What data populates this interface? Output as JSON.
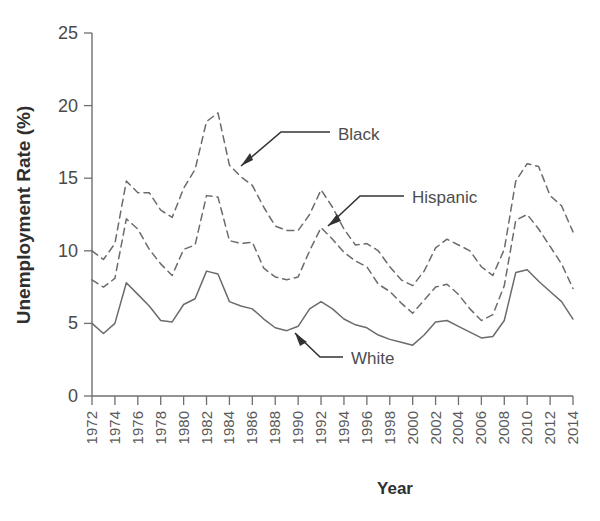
{
  "figure": {
    "background": "#ffffff",
    "line_color": "#6b6b6b",
    "text_color": "#4a4a4a"
  },
  "axes": {
    "ylabel": "Unemployment Rate (%)",
    "xlabel": "Year",
    "yticks": [
      "25",
      "20",
      "15",
      "10",
      "5",
      "0"
    ],
    "xticks": [
      "1972",
      "1974",
      "1976",
      "1978",
      "1980",
      "1982",
      "1984",
      "1986",
      "1988",
      "1990",
      "1992",
      "1994",
      "1996",
      "1998",
      "2000",
      "2002",
      "2004",
      "2006",
      "2008",
      "2010",
      "2012",
      "2014"
    ]
  },
  "annotations": [
    {
      "label": "Black",
      "name": "annotation-black"
    },
    {
      "label": "Hispanic",
      "name": "annotation-hispanic"
    },
    {
      "label": "White",
      "name": "annotation-white"
    }
  ],
  "caption": " ",
  "chart_data": {
    "type": "line",
    "title": "",
    "xlabel": "Year",
    "ylabel": "Unemployment Rate (%)",
    "xlim": [
      1972,
      2014
    ],
    "ylim": [
      0,
      25
    ],
    "grid": false,
    "legend": "annotated-inline",
    "x": [
      1972,
      1973,
      1974,
      1975,
      1976,
      1977,
      1978,
      1979,
      1980,
      1981,
      1982,
      1983,
      1984,
      1985,
      1986,
      1987,
      1988,
      1989,
      1990,
      1991,
      1992,
      1993,
      1994,
      1995,
      1996,
      1997,
      1998,
      1999,
      2000,
      2001,
      2002,
      2003,
      2004,
      2005,
      2006,
      2007,
      2008,
      2009,
      2010,
      2011,
      2012,
      2013,
      2014
    ],
    "series": [
      {
        "name": "Black",
        "style": "dashed",
        "values": [
          10.0,
          9.4,
          10.5,
          14.8,
          14.0,
          14.0,
          12.8,
          12.3,
          14.3,
          15.6,
          18.9,
          19.5,
          15.9,
          15.1,
          14.5,
          13.0,
          11.7,
          11.4,
          11.4,
          12.5,
          14.2,
          13.0,
          11.5,
          10.4,
          10.5,
          10.0,
          8.9,
          8.0,
          7.6,
          8.6,
          10.2,
          10.8,
          10.4,
          10.0,
          8.9,
          8.3,
          10.1,
          14.8,
          16.0,
          15.8,
          13.8,
          13.1,
          11.3
        ]
      },
      {
        "name": "Hispanic",
        "style": "dashed",
        "values": [
          8.0,
          7.5,
          8.1,
          12.2,
          11.5,
          10.1,
          9.1,
          8.3,
          10.1,
          10.4,
          13.8,
          13.7,
          10.7,
          10.5,
          10.6,
          8.8,
          8.2,
          8.0,
          8.2,
          10.0,
          11.6,
          10.8,
          9.9,
          9.3,
          8.9,
          7.7,
          7.2,
          6.4,
          5.7,
          6.6,
          7.5,
          7.7,
          7.0,
          6.0,
          5.2,
          5.6,
          7.6,
          12.1,
          12.5,
          11.5,
          10.3,
          9.1,
          7.4
        ]
      },
      {
        "name": "White",
        "style": "solid",
        "values": [
          5.0,
          4.3,
          5.0,
          7.8,
          7.0,
          6.2,
          5.2,
          5.1,
          6.3,
          6.7,
          8.6,
          8.4,
          6.5,
          6.2,
          6.0,
          5.3,
          4.7,
          4.5,
          4.8,
          6.0,
          6.5,
          6.0,
          5.3,
          4.9,
          4.7,
          4.2,
          3.9,
          3.7,
          3.5,
          4.2,
          5.1,
          5.2,
          4.8,
          4.4,
          4.0,
          4.1,
          5.2,
          8.5,
          8.7,
          7.9,
          7.2,
          6.5,
          5.3
        ]
      }
    ]
  }
}
